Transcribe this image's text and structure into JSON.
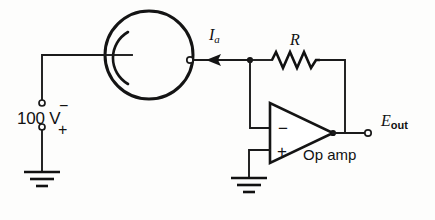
{
  "figure": {
    "ink_color": "#141414",
    "background": "#fdfdfc"
  },
  "labels": {
    "anode_current": "I",
    "anode_current_sub": "a",
    "resistor": "R",
    "supply_voltage": "100 V",
    "supply_negative": "−",
    "supply_positive": "+",
    "opamp_name": "Op amp",
    "opamp_inverting_sign": "−",
    "opamp_noninverting_sign": "+",
    "output_label": "E",
    "output_label_sub": "out"
  },
  "components": {
    "phototube": {
      "name": "phototube",
      "center_x": 149,
      "center_y": 55,
      "radius": 44,
      "cathode": "arc-left-interior",
      "anode_terminal_x": 190,
      "anode_terminal_y": 60
    },
    "battery": {
      "name": "dc-supply",
      "value": "100 V",
      "negative_terminal": {
        "x": 42,
        "y": 103
      },
      "positive_terminal": {
        "x": 42,
        "y": 127
      }
    },
    "resistor": {
      "name": "feedback-resistor",
      "label": "R",
      "x_start": 272,
      "x_end": 320,
      "y": 60
    },
    "opamp": {
      "name": "operational-amplifier",
      "apex_x": 333,
      "apex_y": 133,
      "left_x": 270,
      "top_y": 103,
      "bottom_y": 163
    },
    "grounds": [
      {
        "name": "supply-ground",
        "x": 42,
        "y": 172
      },
      {
        "name": "noninverting-ground",
        "x": 249,
        "y": 178
      }
    ],
    "output_terminal": {
      "x": 368,
      "y": 133
    },
    "summing_node": {
      "x": 250,
      "y": 60
    },
    "output_node": {
      "x": 333,
      "y": 133
    }
  }
}
